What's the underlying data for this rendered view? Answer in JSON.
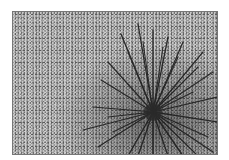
{
  "image": {
    "subject": "sea urchin on sand",
    "style": "grayscale photograph",
    "colors": {
      "sand": "#9a9a9a",
      "spines": "#1e1e1e",
      "border": "#777777",
      "background": "#ffffff"
    }
  }
}
